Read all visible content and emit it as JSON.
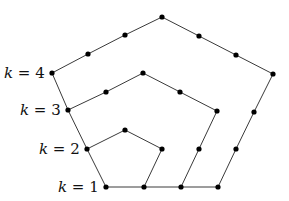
{
  "diagram": {
    "title": "",
    "type": "nested pentagon lattice",
    "colors": {
      "edge": "#3a3a3a",
      "node": "#000000",
      "label": "#111111"
    },
    "labels": [
      {
        "id": "k4",
        "var": "k",
        "eq": " = ",
        "value": "4",
        "x": 4,
        "y": 78
      },
      {
        "id": "k3",
        "var": "k",
        "eq": " = ",
        "value": "3",
        "x": 20,
        "y": 115
      },
      {
        "id": "k2",
        "var": "k",
        "eq": " = ",
        "value": "2",
        "x": 39,
        "y": 154
      },
      {
        "id": "k1",
        "var": "k",
        "eq": " = ",
        "value": "1",
        "x": 58,
        "y": 192
      }
    ],
    "paths": [
      {
        "id": "outer-k4",
        "points": [
          [
            52,
            73
          ],
          [
            88,
            54
          ],
          [
            125,
            35
          ],
          [
            162,
            17
          ],
          [
            199,
            36
          ],
          [
            236,
            55
          ],
          [
            273,
            74
          ],
          [
            254,
            112
          ],
          [
            236,
            149
          ],
          [
            218,
            187
          ]
        ]
      },
      {
        "id": "middle-k3",
        "points": [
          [
            68,
            110
          ],
          [
            106,
            92
          ],
          [
            143,
            73
          ],
          [
            180,
            92
          ],
          [
            217,
            111
          ],
          [
            199,
            149
          ],
          [
            181,
            187
          ]
        ]
      },
      {
        "id": "inner-k2",
        "points": [
          [
            87,
            149
          ],
          [
            125,
            130
          ],
          [
            162,
            149
          ],
          [
            144,
            187
          ]
        ]
      },
      {
        "id": "left-spine",
        "points": [
          [
            52,
            73
          ],
          [
            68,
            110
          ],
          [
            87,
            149
          ],
          [
            106,
            187
          ]
        ]
      },
      {
        "id": "base-k1",
        "points": [
          [
            106,
            187
          ],
          [
            144,
            187
          ],
          [
            181,
            187
          ],
          [
            218,
            187
          ]
        ]
      }
    ],
    "nodes": [
      [
        52,
        73
      ],
      [
        88,
        54
      ],
      [
        125,
        35
      ],
      [
        162,
        17
      ],
      [
        199,
        36
      ],
      [
        236,
        55
      ],
      [
        273,
        74
      ],
      [
        254,
        112
      ],
      [
        236,
        149
      ],
      [
        218,
        187
      ],
      [
        68,
        110
      ],
      [
        106,
        92
      ],
      [
        143,
        73
      ],
      [
        180,
        92
      ],
      [
        217,
        111
      ],
      [
        199,
        149
      ],
      [
        181,
        187
      ],
      [
        87,
        149
      ],
      [
        125,
        130
      ],
      [
        162,
        149
      ],
      [
        144,
        187
      ],
      [
        106,
        187
      ]
    ]
  }
}
